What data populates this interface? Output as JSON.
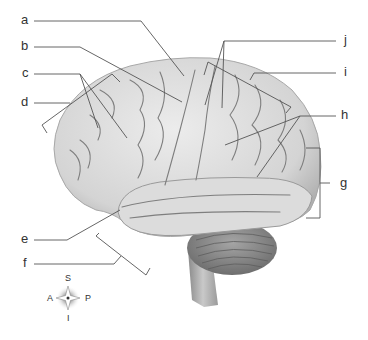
{
  "diagram": {
    "type": "labeled anatomical illustration",
    "labels": [
      {
        "id": "a",
        "text": "a"
      },
      {
        "id": "b",
        "text": "b"
      },
      {
        "id": "c",
        "text": "c"
      },
      {
        "id": "d",
        "text": "d"
      },
      {
        "id": "e",
        "text": "e"
      },
      {
        "id": "f",
        "text": "f"
      },
      {
        "id": "g",
        "text": "g"
      },
      {
        "id": "h",
        "text": "h"
      },
      {
        "id": "i",
        "text": "i"
      },
      {
        "id": "j",
        "text": "j"
      }
    ],
    "compass": {
      "S": "S",
      "A": "A",
      "P": "P",
      "I": "I"
    }
  },
  "colors": {
    "brain_light": "#e2e2e2",
    "brain_mid": "#bdbdbd",
    "sulcus": "#7a7a7a",
    "cerebellum": "#8f8f8f",
    "leader": "#555555",
    "text": "#333333"
  }
}
